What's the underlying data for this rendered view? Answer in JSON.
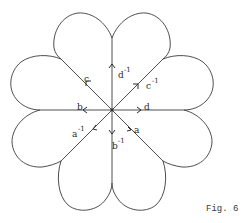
{
  "figure": {
    "caption": "Fig. 6",
    "colors": {
      "line": "#3a3a3a",
      "text": "#2a2a2a",
      "background": "#ffffff"
    },
    "center": {
      "x": 112,
      "y": 110
    },
    "edges": [
      {
        "label": "d",
        "exponent": "",
        "direction": "east",
        "arrow": "outward"
      },
      {
        "label": "d",
        "exponent": "-1",
        "direction": "north",
        "arrow": "outward"
      },
      {
        "label": "b",
        "exponent": "",
        "direction": "west",
        "arrow": "outward"
      },
      {
        "label": "b",
        "exponent": "-1",
        "direction": "south",
        "arrow": "outward"
      },
      {
        "label": "c",
        "exponent": "",
        "direction": "northwest",
        "arrow": "outward"
      },
      {
        "label": "c",
        "exponent": "-1",
        "direction": "northeast",
        "arrow": "outward"
      },
      {
        "label": "a",
        "exponent": "",
        "direction": "southeast",
        "arrow": "inward"
      },
      {
        "label": "a",
        "exponent": "-1",
        "direction": "southwest",
        "arrow": "inward"
      }
    ],
    "petal_count": 8
  }
}
